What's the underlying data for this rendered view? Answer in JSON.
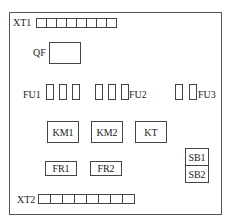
{
  "panel": {
    "terminal_top": {
      "label": "XT1",
      "cells": 8
    },
    "breaker": {
      "label": "QF"
    },
    "fuses": [
      {
        "label": "FU1",
        "count": 3
      },
      {
        "label": "FU2",
        "count": 3
      },
      {
        "label": "FU3",
        "count": 2
      }
    ],
    "contactors": [
      {
        "label": "KM1"
      },
      {
        "label": "KM2"
      },
      {
        "label": "KT"
      }
    ],
    "relays": [
      {
        "label": "FR1"
      },
      {
        "label": "FR2"
      }
    ],
    "buttons": [
      {
        "label": "SB1"
      },
      {
        "label": "SB2"
      }
    ],
    "terminal_bottom": {
      "label": "XT2",
      "cells": 8
    }
  }
}
